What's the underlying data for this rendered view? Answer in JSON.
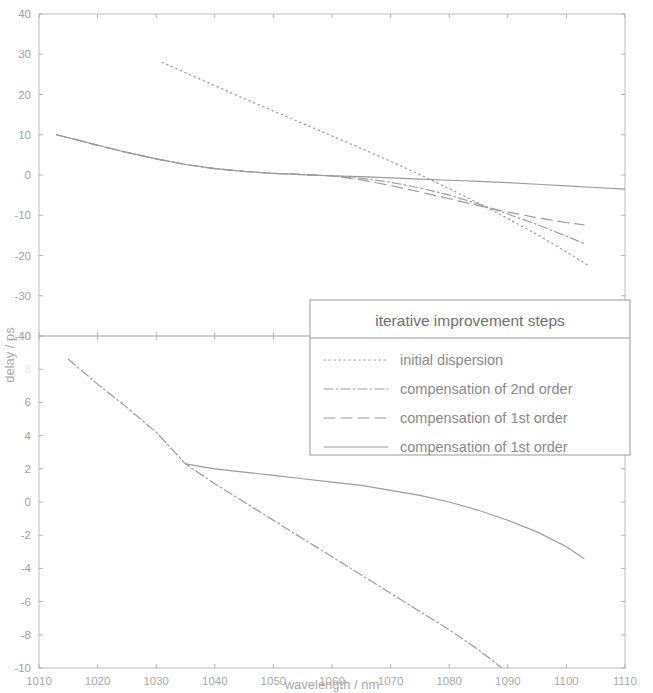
{
  "figure": {
    "background_color": "#ffffff",
    "line_color": "#9c9c9c",
    "text_color": "#a2a2a2"
  },
  "axes": {
    "xlabel": "wavelength / nm",
    "ylabel": "delay / ps",
    "x_ticks": [
      "1010",
      "1020",
      "1030",
      "1040",
      "1050",
      "1060",
      "1070",
      "1080",
      "1090",
      "1100",
      "1110"
    ],
    "upper_y_ticks": [
      "40",
      "30",
      "20",
      "10",
      "0",
      "-10",
      "-20",
      "-30",
      "-40"
    ],
    "lower_y_ticks": [
      "10",
      "8",
      "6",
      "4",
      "2",
      "0",
      "-2",
      "-4",
      "-6",
      "-8",
      "-10"
    ]
  },
  "legend": {
    "title": "iterative improvement steps",
    "entries": [
      {
        "label": "initial dispersion",
        "style": "dotted"
      },
      {
        "label": "compensation of 2nd order",
        "style": "dashdot"
      },
      {
        "label": "compensation of 1st order",
        "style": "dashed"
      },
      {
        "label": "compensation of 1st order",
        "style": "solid"
      }
    ]
  },
  "chart_data": {
    "type": "line",
    "title": "",
    "xlabel": "wavelength / nm",
    "ylabel": "delay / ps",
    "grid": false,
    "legend_position": "center-right",
    "legend_title": "iterative improvement steps",
    "panels": [
      {
        "name": "upper",
        "xlim": [
          1010,
          1110
        ],
        "ylim": [
          -40,
          40
        ],
        "xticks": [
          1010,
          1020,
          1030,
          1040,
          1050,
          1060,
          1070,
          1080,
          1090,
          1100,
          1110
        ],
        "yticks": [
          -40,
          -30,
          -20,
          -10,
          0,
          10,
          20,
          30,
          40
        ],
        "series": [
          {
            "name": "initial dispersion",
            "style": "dotted",
            "x": [
              1031,
              1035,
              1040,
              1045,
              1050,
              1055,
              1060,
              1065,
              1070,
              1075,
              1080,
              1085,
              1090,
              1095,
              1100,
              1104
            ],
            "y": [
              28.0,
              25.4,
              22.2,
              19.0,
              15.9,
              12.8,
              9.7,
              6.6,
              3.4,
              0.1,
              -3.4,
              -7.0,
              -10.8,
              -14.8,
              -19.1,
              -22.7
            ]
          },
          {
            "name": "compensation of 2nd order",
            "style": "dashdot",
            "x": [
              1013,
              1020,
              1025,
              1030,
              1035,
              1040,
              1045,
              1050,
              1055,
              1060,
              1065,
              1070,
              1075,
              1080,
              1085,
              1090,
              1095,
              1100,
              1103
            ],
            "y": [
              10.0,
              7.4,
              5.6,
              4.0,
              2.6,
              1.6,
              0.9,
              0.4,
              0.1,
              -0.2,
              -0.8,
              -1.8,
              -3.2,
              -5.0,
              -7.2,
              -9.7,
              -12.3,
              -15.2,
              -17.0
            ]
          },
          {
            "name": "compensation of 1st order",
            "style": "dashed",
            "x": [
              1013,
              1020,
              1025,
              1030,
              1035,
              1040,
              1045,
              1050,
              1055,
              1060,
              1065,
              1070,
              1075,
              1080,
              1085,
              1090,
              1095,
              1100,
              1103
            ],
            "y": [
              10.0,
              7.4,
              5.6,
              4.0,
              2.6,
              1.6,
              0.9,
              0.4,
              0.1,
              -0.2,
              -1.2,
              -2.6,
              -4.2,
              -5.9,
              -7.6,
              -9.2,
              -10.6,
              -11.8,
              -12.4
            ]
          },
          {
            "name": "compensation of 1st order",
            "style": "solid",
            "x": [
              1013,
              1020,
              1025,
              1030,
              1035,
              1040,
              1045,
              1050,
              1055,
              1060,
              1065,
              1070,
              1075,
              1080,
              1085,
              1090,
              1095,
              1100,
              1105,
              1110
            ],
            "y": [
              10.0,
              7.4,
              5.6,
              4.0,
              2.6,
              1.6,
              0.9,
              0.4,
              0.1,
              -0.2,
              -0.4,
              -0.7,
              -1.0,
              -1.3,
              -1.6,
              -1.9,
              -2.3,
              -2.7,
              -3.1,
              -3.5
            ]
          }
        ]
      },
      {
        "name": "lower",
        "xlim": [
          1010,
          1110
        ],
        "ylim": [
          -10,
          10
        ],
        "xticks": [
          1010,
          1020,
          1030,
          1040,
          1050,
          1060,
          1070,
          1080,
          1090,
          1100,
          1110
        ],
        "yticks": [
          -10,
          -8,
          -6,
          -4,
          -2,
          0,
          2,
          4,
          6,
          8,
          10
        ],
        "series": [
          {
            "name": "compensation of 2nd order",
            "style": "dashdot",
            "x": [
              1015,
              1020,
              1025,
              1030,
              1035,
              1040,
              1045,
              1050,
              1055,
              1060,
              1065,
              1070,
              1075,
              1080,
              1085,
              1089
            ],
            "y": [
              8.6,
              7.1,
              5.7,
              4.2,
              2.3,
              1.1,
              0.0,
              -1.1,
              -2.2,
              -3.3,
              -4.4,
              -5.5,
              -6.6,
              -7.7,
              -8.9,
              -10.0
            ]
          },
          {
            "name": "compensation of 1st order",
            "style": "solid",
            "x": [
              1035,
              1040,
              1045,
              1050,
              1055,
              1060,
              1065,
              1070,
              1075,
              1080,
              1085,
              1090,
              1095,
              1100,
              1103
            ],
            "y": [
              2.3,
              2.0,
              1.8,
              1.6,
              1.4,
              1.2,
              1.0,
              0.7,
              0.4,
              0.0,
              -0.5,
              -1.1,
              -1.8,
              -2.7,
              -3.4
            ]
          }
        ]
      }
    ]
  }
}
